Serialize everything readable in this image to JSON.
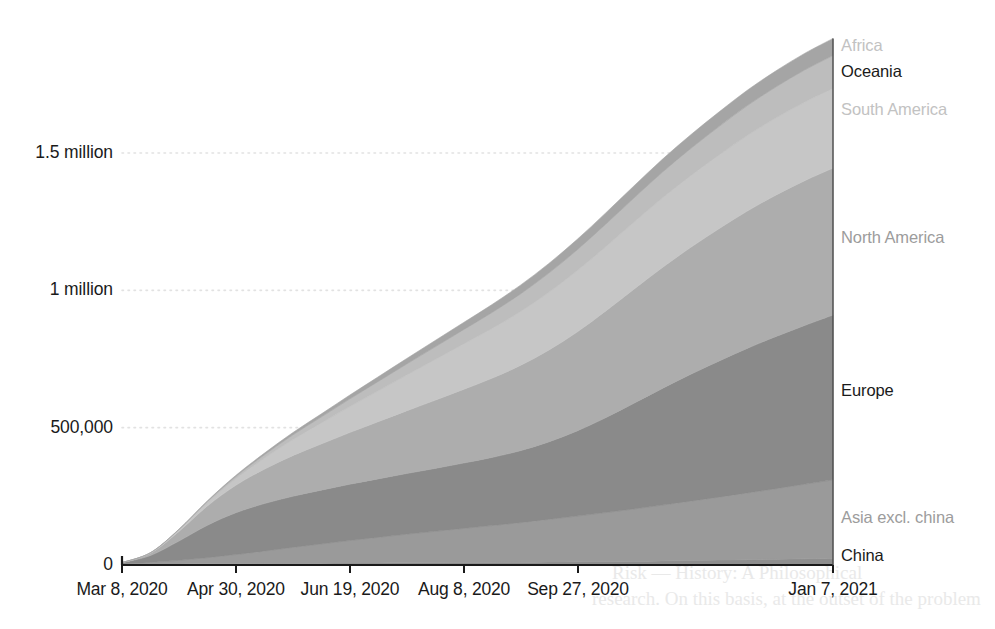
{
  "chart_data": {
    "type": "area",
    "stacked": true,
    "title": "",
    "subtitle": "",
    "xlabel": "",
    "ylabel": "",
    "grid": "horizontal-dotted",
    "legend_position": "right-inline-labels",
    "ylim": [
      0,
      1950000
    ],
    "y_ticks": [
      {
        "value": 0,
        "label": "0"
      },
      {
        "value": 500000,
        "label": "500,000"
      },
      {
        "value": 1000000,
        "label": "1 million"
      },
      {
        "value": 1500000,
        "label": "1.5 million"
      }
    ],
    "x_ticks": [
      {
        "index": 0,
        "label": "Mar 8, 2020"
      },
      {
        "index": 1,
        "label": "Apr 30, 2020"
      },
      {
        "index": 2,
        "label": "Jun 19, 2020"
      },
      {
        "index": 3,
        "label": "Aug 8, 2020"
      },
      {
        "index": 4,
        "label": "Sep 27, 2020"
      },
      {
        "index": 5,
        "label": "Jan 7, 2021"
      }
    ],
    "x_tick_positions_px": [
      122,
      236,
      350,
      464,
      578,
      833
    ],
    "x_domain": [
      "Mar 8, 2020",
      "Jan 7, 2021"
    ],
    "x": [
      0,
      0.04,
      0.08,
      0.12,
      0.16,
      0.2,
      0.24,
      0.28,
      0.32,
      0.36,
      0.4,
      0.44,
      0.48,
      0.52,
      0.56,
      0.6,
      0.64,
      0.68,
      0.72,
      0.76,
      0.8,
      0.84,
      0.88,
      0.92,
      0.96,
      1.0
    ],
    "series": [
      {
        "name": "China",
        "color": "#8e8e8e",
        "label_color": "#1a1a1a",
        "final_value": 25000,
        "values": [
          3000,
          3500,
          4000,
          4500,
          5000,
          5500,
          6000,
          6500,
          7000,
          7500,
          8000,
          8500,
          9000,
          9500,
          10000,
          11000,
          12000,
          13000,
          14000,
          15000,
          16500,
          18000,
          19500,
          21000,
          23000,
          25000
        ]
      },
      {
        "name": "Asia excl. china",
        "color": "#9a9a9a",
        "label_color": "#9c9c9c",
        "final_value": 285000,
        "values": [
          2000,
          6000,
          13000,
          22000,
          33000,
          45000,
          58000,
          70000,
          82000,
          93000,
          104000,
          114000,
          124000,
          134000,
          144000,
          155000,
          166000,
          178000,
          190000,
          203000,
          216000,
          229000,
          243000,
          257000,
          271000,
          285000
        ]
      },
      {
        "name": "Europe",
        "color": "#8a8a8a",
        "label_color": "#1a1a1a",
        "final_value": 600000,
        "values": [
          3000,
          25000,
          70000,
          118000,
          152000,
          173000,
          186000,
          196000,
          205000,
          213000,
          221000,
          229000,
          238000,
          248000,
          262000,
          282000,
          310000,
          345000,
          385000,
          425000,
          462000,
          496000,
          527000,
          554000,
          578000,
          600000
        ]
      },
      {
        "name": "North America",
        "color": "#adadad",
        "label_color": "#9c9c9c",
        "final_value": 535000,
        "values": [
          500,
          8000,
          35000,
          70000,
          100000,
          125000,
          148000,
          168000,
          188000,
          208000,
          228000,
          248000,
          268000,
          288000,
          310000,
          334000,
          360000,
          388000,
          415000,
          440000,
          462000,
          482000,
          500000,
          515000,
          527000,
          535000
        ]
      },
      {
        "name": "South America",
        "color": "#c6c6c6",
        "label_color": "#c2c2c2",
        "final_value": 290000,
        "values": [
          200,
          1500,
          5000,
          12000,
          24000,
          40000,
          58000,
          76000,
          94000,
          112000,
          130000,
          148000,
          165000,
          181000,
          196000,
          210000,
          223000,
          234000,
          244000,
          253000,
          261000,
          268000,
          275000,
          281000,
          286000,
          290000
        ]
      },
      {
        "name": "Oceania",
        "color": "#bdbdbd",
        "label_color": "#1a1a1a",
        "final_value": 120000,
        "values": [
          100,
          600,
          2000,
          4500,
          8000,
          12000,
          17000,
          22000,
          28000,
          34000,
          40000,
          46000,
          52000,
          58000,
          64000,
          70000,
          76000,
          82000,
          88000,
          94000,
          99000,
          104000,
          109000,
          113000,
          117000,
          120000
        ]
      },
      {
        "name": "Africa",
        "color": "#a5a5a5",
        "label_color": "#c2c2c2",
        "final_value": 62000,
        "values": [
          50,
          300,
          1000,
          2200,
          4000,
          6000,
          8500,
          11000,
          14000,
          17000,
          20000,
          23000,
          26000,
          29000,
          32000,
          35000,
          38000,
          41000,
          44000,
          47000,
          50000,
          53000,
          56000,
          58500,
          60500,
          62000
        ]
      }
    ],
    "total_final": 1917000
  },
  "axis": {
    "axis_color": "#1a1a1a",
    "gridline_color": "#e2e2e2"
  },
  "ghost_text": {
    "line1": "Risk — History: A Philosophical",
    "line2": "research. On this basis, at the outset of the problem"
  }
}
